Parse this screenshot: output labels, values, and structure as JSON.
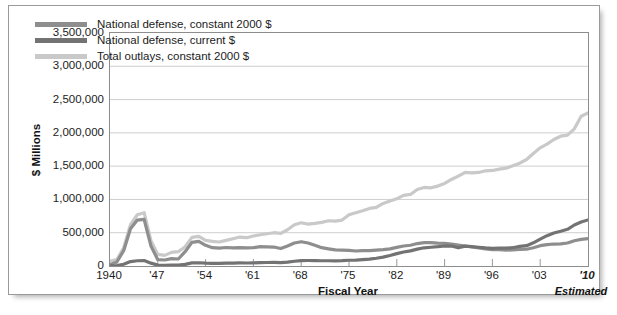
{
  "chart_data": {
    "type": "line",
    "title": "",
    "xlabel": "Fiscal Year",
    "ylabel": "$ Millions",
    "xlim": [
      1940,
      2010
    ],
    "ylim": [
      0,
      3500000
    ],
    "grid": true,
    "legend_position": "upper-left-inside",
    "annotations": [
      "Estimated"
    ],
    "ytick_labels": [
      "3,500,000",
      "3,000,000",
      "2,500,000",
      "2,000,000",
      "1,500,000",
      "1,000,000",
      "500,000",
      "0"
    ],
    "ytick_values": [
      3500000,
      3000000,
      2500000,
      2000000,
      1500000,
      1000000,
      500000,
      0
    ],
    "xtick_labels": [
      "1940",
      "'47",
      "'54",
      "'61",
      "'68",
      "'75",
      "'82",
      "'89",
      "'96",
      "'03",
      "'10"
    ],
    "xtick_values": [
      1940,
      1947,
      1954,
      1961,
      1968,
      1975,
      1982,
      1989,
      1996,
      2003,
      2010
    ],
    "x": [
      1940,
      1941,
      1942,
      1943,
      1944,
      1945,
      1946,
      1947,
      1948,
      1949,
      1950,
      1951,
      1952,
      1953,
      1954,
      1955,
      1956,
      1957,
      1958,
      1959,
      1960,
      1961,
      1962,
      1963,
      1964,
      1965,
      1966,
      1967,
      1968,
      1969,
      1970,
      1971,
      1972,
      1973,
      1974,
      1975,
      1976,
      1977,
      1978,
      1979,
      1980,
      1981,
      1982,
      1983,
      1984,
      1985,
      1986,
      1987,
      1988,
      1989,
      1990,
      1991,
      1992,
      1993,
      1994,
      1995,
      1996,
      1997,
      1998,
      1999,
      2000,
      2001,
      2002,
      2003,
      2004,
      2005,
      2006,
      2007,
      2008,
      2009,
      2010
    ],
    "series": [
      {
        "name": "National defense, constant 2000 $",
        "color": "#8e8e8e",
        "values": [
          18000,
          60000,
          230000,
          560000,
          690000,
          700000,
          300000,
          95000,
          90000,
          110000,
          105000,
          215000,
          355000,
          370000,
          310000,
          275000,
          270000,
          278000,
          272000,
          277000,
          272000,
          275000,
          290000,
          288000,
          285000,
          262000,
          300000,
          345000,
          365000,
          345000,
          310000,
          275000,
          258000,
          243000,
          238000,
          235000,
          225000,
          230000,
          230000,
          237000,
          246000,
          258000,
          280000,
          300000,
          312000,
          337000,
          350000,
          352000,
          345000,
          342000,
          330000,
          315000,
          300000,
          285000,
          270000,
          258000,
          245000,
          245000,
          238000,
          243000,
          248000,
          252000,
          275000,
          305000,
          320000,
          330000,
          332000,
          345000,
          380000,
          400000,
          410000
        ]
      },
      {
        "name": "National defense, current $",
        "color": "#737373",
        "values": [
          1660,
          6435,
          25658,
          66699,
          79143,
          82965,
          42681,
          12808,
          9105,
          13150,
          13724,
          23566,
          46089,
          48747,
          42786,
          40245,
          40641,
          43270,
          44142,
          46426,
          45195,
          47381,
          51097,
          52257,
          53591,
          50620,
          58111,
          71417,
          81926,
          82497,
          81692,
          78872,
          79174,
          76681,
          79347,
          86509,
          89619,
          97241,
          104495,
          116342,
          133995,
          157513,
          185309,
          209903,
          227413,
          252748,
          273375,
          281999,
          290361,
          303559,
          299331,
          273292,
          298350,
          291086,
          281642,
          272066,
          265753,
          270505,
          268207,
          274769,
          294363,
          304732,
          348456,
          404733,
          455807,
          495294,
          521840,
          551258,
          616066,
          661049,
          692000
        ]
      },
      {
        "name": "Total outlays, constant 2000 $",
        "color": "#c9c9c9",
        "values": [
          72000,
          95000,
          275000,
          620000,
          770000,
          800000,
          380000,
          175000,
          160000,
          205000,
          215000,
          290000,
          430000,
          445000,
          385000,
          370000,
          360000,
          385000,
          410000,
          435000,
          425000,
          450000,
          470000,
          485000,
          500000,
          490000,
          545000,
          620000,
          650000,
          630000,
          640000,
          655000,
          680000,
          675000,
          690000,
          770000,
          800000,
          830000,
          865000,
          880000,
          940000,
          975000,
          1010000,
          1060000,
          1075000,
          1150000,
          1180000,
          1175000,
          1200000,
          1240000,
          1300000,
          1350000,
          1405000,
          1400000,
          1405000,
          1430000,
          1435000,
          1455000,
          1470000,
          1505000,
          1545000,
          1600000,
          1690000,
          1775000,
          1830000,
          1900000,
          1950000,
          1965000,
          2060000,
          2250000,
          2300000
        ]
      }
    ]
  },
  "axis": {
    "ylabel": "$ Millions",
    "xlabel": "Fiscal Year",
    "estimated_note": "Estimated"
  },
  "legend": {
    "items": [
      {
        "label": "National defense, constant 2000 $",
        "color": "#8e8e8e"
      },
      {
        "label": "National defense, current $",
        "color": "#737373"
      },
      {
        "label": "Total outlays, constant 2000 $",
        "color": "#c9c9c9"
      }
    ]
  }
}
